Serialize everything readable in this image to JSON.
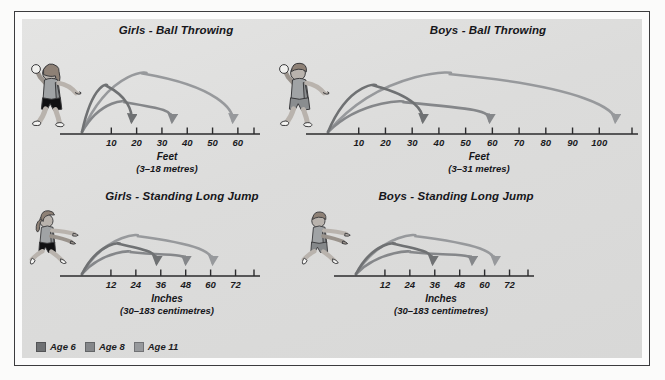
{
  "poster": {
    "background_color": "#dedede",
    "frame_color": "#3c3c3e"
  },
  "legend": {
    "name": "age-legend",
    "items": [
      {
        "label": "Age 6",
        "color": "#6f7173"
      },
      {
        "label": "Age 8",
        "color": "#85878a"
      },
      {
        "label": "Age 11",
        "color": "#97999c"
      }
    ]
  },
  "charts": [
    {
      "id": "girls-ball-throwing",
      "title": "Girls - Ball Throwing",
      "unit": "Feet",
      "conversion": "(3–18 metres)",
      "figure": "girl-throwing",
      "ticks": [
        10,
        20,
        30,
        40,
        50,
        60
      ],
      "axis_max": 64,
      "values": [
        18,
        34,
        58
      ]
    },
    {
      "id": "boys-ball-throwing",
      "title": "Boys - Ball Throwing",
      "unit": "Feet",
      "conversion": "(3–31 metres)",
      "figure": "boy-throwing",
      "ticks": [
        10,
        20,
        30,
        40,
        50,
        60,
        70,
        80,
        90,
        100
      ],
      "axis_max": 110,
      "values": [
        34,
        59,
        106
      ]
    },
    {
      "id": "girls-standing-long-jump",
      "title": "Girls - Standing Long Jump",
      "unit": "Inches",
      "conversion": "(30–183 centimetres)",
      "figure": "girl-jumping",
      "ticks": [
        12,
        24,
        36,
        48,
        60,
        72
      ],
      "axis_max": 78,
      "values": [
        34,
        48,
        61
      ]
    },
    {
      "id": "boys-standing-long-jump",
      "title": "Boys - Standing Long Jump",
      "unit": "Inches",
      "conversion": "(30–183 centimetres)",
      "figure": "boy-jumping",
      "ticks": [
        12,
        24,
        36,
        48,
        60,
        72
      ],
      "axis_max": 78,
      "values": [
        35,
        54,
        65
      ]
    }
  ],
  "chart_data": {
    "type": "bar",
    "xlabel": "Distance",
    "ylabel": "",
    "grid": false,
    "legend_position": "bottom-left",
    "categories": [
      "Age 6",
      "Age 8",
      "Age 11"
    ],
    "panels": [
      {
        "name": "Girls - Ball Throwing",
        "unit": "Feet",
        "conversion": "(3–18 metres)",
        "axis_ticks": [
          10,
          20,
          30,
          40,
          50,
          60
        ],
        "xlim": [
          0,
          64
        ],
        "values": [
          18,
          34,
          58
        ]
      },
      {
        "name": "Boys - Ball Throwing",
        "unit": "Feet",
        "conversion": "(3–31 metres)",
        "axis_ticks": [
          10,
          20,
          30,
          40,
          50,
          60,
          70,
          80,
          90,
          100
        ],
        "xlim": [
          0,
          110
        ],
        "values": [
          34,
          59,
          106
        ]
      },
      {
        "name": "Girls - Standing Long Jump",
        "unit": "Inches",
        "conversion": "(30–183 centimetres)",
        "axis_ticks": [
          12,
          24,
          36,
          48,
          60,
          72
        ],
        "xlim": [
          0,
          78
        ],
        "values": [
          34,
          48,
          61
        ]
      },
      {
        "name": "Boys - Standing Long Jump",
        "unit": "Inches",
        "conversion": "(30–183 centimetres)",
        "axis_ticks": [
          12,
          24,
          36,
          48,
          60,
          72
        ],
        "xlim": [
          0,
          78
        ],
        "values": [
          35,
          54,
          65
        ]
      }
    ]
  }
}
